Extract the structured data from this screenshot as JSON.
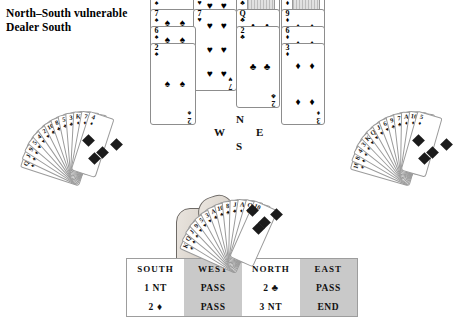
{
  "header": {
    "line1": "North–South vulnerable",
    "line2": "Dealer South"
  },
  "compass": {
    "north": "N",
    "west": "W",
    "east": "E",
    "south": "S"
  },
  "suits": {
    "spade": "♠",
    "heart": "♥",
    "club": "♣",
    "diamond": "♦"
  },
  "north_hand": {
    "label": "North hand",
    "columns": [
      {
        "suit_name": "spades",
        "suit": "♠",
        "cards": [
          {
            "rank": "A",
            "suit": "♠",
            "pips": 1
          },
          {
            "rank": "7",
            "suit": "♠",
            "pips": 7
          },
          {
            "rank": "6",
            "suit": "♠",
            "pips": 6
          },
          {
            "rank": "2",
            "suit": "♠",
            "pips": 2
          }
        ]
      },
      {
        "suit_name": "hearts",
        "suit": "♥",
        "cards": [
          {
            "rank": "8",
            "suit": "♥",
            "pips": 8
          },
          {
            "rank": "7",
            "suit": "♥",
            "pips": 7
          }
        ]
      },
      {
        "suit_name": "clubs",
        "suit": "♣",
        "cards": [
          {
            "rank": "K",
            "suit": "♣",
            "pips": 0
          },
          {
            "rank": "Q",
            "suit": "♣",
            "pips": 4
          },
          {
            "rank": "2",
            "suit": "♣",
            "pips": 2
          }
        ]
      },
      {
        "suit_name": "diamonds",
        "suit": "♦",
        "cards": [
          {
            "rank": "K",
            "suit": "♦",
            "pips": 0
          },
          {
            "rank": "9",
            "suit": "♦",
            "pips": 4
          },
          {
            "rank": "6",
            "suit": "♦",
            "pips": 4
          },
          {
            "rank": "3",
            "suit": "♦",
            "pips": 3
          }
        ]
      }
    ]
  },
  "west_hand": {
    "label": "West hand",
    "card_count": 13,
    "indices": [
      "Q",
      "J",
      "9",
      "5",
      "4",
      "2",
      "10",
      "8",
      "5",
      "3",
      "K",
      "7",
      "4"
    ],
    "suit_marks": [
      "♠",
      "♠",
      "♠",
      "♥",
      "♥",
      "♥",
      "♣",
      "♣",
      "♣",
      "♣",
      "♦",
      "♦",
      "♦"
    ]
  },
  "east_hand": {
    "label": "East hand",
    "card_count": 13,
    "indices": [
      "10",
      "8",
      "4",
      "3",
      "K",
      "Q",
      "J",
      "6",
      "9",
      "7",
      "A",
      "10",
      "5"
    ],
    "suit_marks": [
      "♠",
      "♠",
      "♠",
      "♠",
      "♥",
      "♥",
      "♥",
      "♥",
      "♣",
      "♣",
      "♦",
      "♦",
      "♦"
    ]
  },
  "south_hand": {
    "label": "South hand",
    "card_count": 13,
    "indices": [
      "K",
      "Q",
      "J",
      "9",
      "5",
      "3",
      "A",
      "10",
      "8",
      "J",
      "A",
      "Q",
      "10"
    ],
    "suit_marks": [
      "♠",
      "♠",
      "♠",
      "♥",
      "♥",
      "♥",
      "♣",
      "♣",
      "♣",
      "♣",
      "♦",
      "♦",
      "♦"
    ]
  },
  "bidding": {
    "headers": [
      "SOUTH",
      "WEST",
      "NORTH",
      "EAST"
    ],
    "rows": [
      [
        {
          "text": "1 NT",
          "suit": ""
        },
        {
          "text": "PASS",
          "suit": ""
        },
        {
          "text": "2",
          "suit": "♣"
        },
        {
          "text": "PASS",
          "suit": ""
        }
      ],
      [
        {
          "text": "2",
          "suit": "♦"
        },
        {
          "text": "PASS",
          "suit": ""
        },
        {
          "text": "3 NT",
          "suit": ""
        },
        {
          "text": "END",
          "suit": ""
        }
      ]
    ],
    "column_shading": [
      "plain",
      "shade",
      "plain",
      "shade"
    ]
  },
  "colors": {
    "page_background": "#ffffff",
    "table_shade": "#c9c9c9",
    "table_plain": "#ffffff",
    "card_border": "#8d8d8d",
    "ink": "#111111",
    "court_art": "#dcdcdc"
  }
}
